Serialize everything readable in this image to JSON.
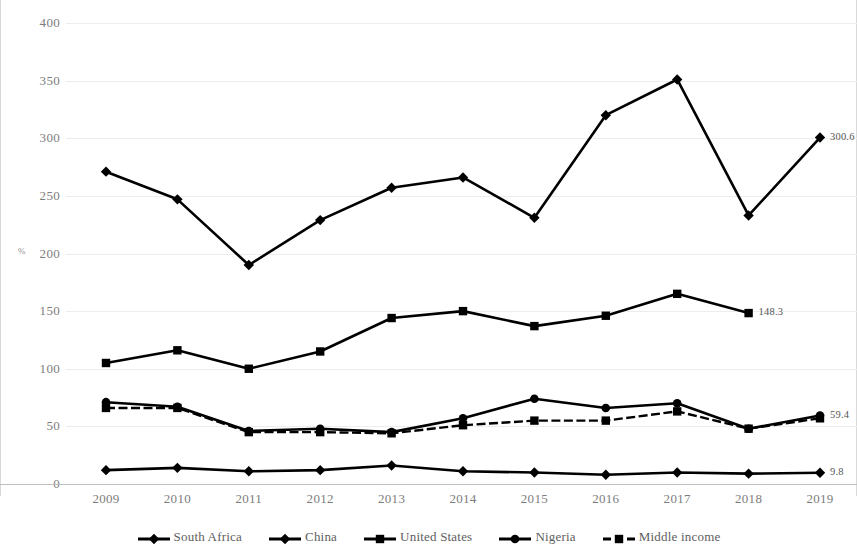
{
  "chart_data": {
    "type": "line",
    "title": "",
    "subtitle": "",
    "xlabel": "",
    "ylabel": "%",
    "categories": [
      "2009",
      "2010",
      "2011",
      "2012",
      "2013",
      "2014",
      "2015",
      "2016",
      "2017",
      "2018",
      "2019"
    ],
    "x": [
      2009,
      2010,
      2011,
      2012,
      2013,
      2014,
      2015,
      2016,
      2017,
      2018,
      2019
    ],
    "ylim": [
      0,
      400
    ],
    "yticks": [
      0,
      50,
      100,
      150,
      200,
      250,
      300,
      350,
      400
    ],
    "ytick_labels": [
      "0",
      "50",
      "100",
      "150",
      "200",
      "250",
      "300",
      "350",
      "400"
    ],
    "grid": true,
    "legend_position": "bottom",
    "series": [
      {
        "name": "South Africa",
        "marker": "diamond",
        "line_style": "solid",
        "color": "#000000",
        "values": [
          271,
          247,
          190,
          229,
          257,
          266,
          231,
          320,
          351,
          233,
          300.6
        ],
        "end_label": "300.6"
      },
      {
        "name": "China",
        "marker": "diamond",
        "line_style": "solid",
        "color": "#000000",
        "values": [
          12,
          14,
          11,
          12,
          16,
          11,
          10,
          8,
          10,
          9,
          9.8
        ],
        "end_label": "9.8"
      },
      {
        "name": "United States",
        "marker": "square",
        "line_style": "solid",
        "color": "#000000",
        "values": [
          105,
          116,
          100,
          115,
          144,
          150,
          137,
          146,
          165,
          148.3,
          null
        ],
        "end_label": "148.3"
      },
      {
        "name": "Nigeria",
        "marker": "circle",
        "line_style": "solid",
        "color": "#000000",
        "values": [
          71,
          67,
          46,
          48,
          45,
          57,
          74,
          66,
          70,
          48,
          59.4
        ],
        "end_label": "59.4"
      },
      {
        "name": "Middle income",
        "marker": "square",
        "line_style": "dashed",
        "color": "#000000",
        "values": [
          66,
          66,
          45,
          45,
          44,
          51,
          55,
          55,
          63,
          48,
          57
        ],
        "end_label": ""
      }
    ],
    "annotations": [
      {
        "text": "300.6",
        "series": "South Africa",
        "x": 2019
      },
      {
        "text": "148.3",
        "series": "United States",
        "x": 2018
      },
      {
        "text": "59.4",
        "series": "Nigeria",
        "x": 2019
      },
      {
        "text": "9.8",
        "series": "China",
        "x": 2019
      }
    ]
  }
}
